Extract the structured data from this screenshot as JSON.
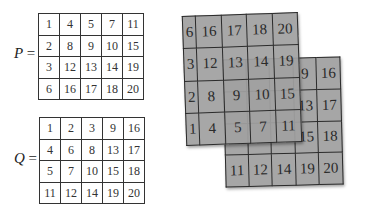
{
  "matrix_p": {
    "label": "P",
    "equals": "=",
    "rows": [
      [
        "1",
        "4",
        "5",
        "7",
        "11"
      ],
      [
        "2",
        "8",
        "9",
        "10",
        "15"
      ],
      [
        "3",
        "12",
        "13",
        "14",
        "19"
      ],
      [
        "6",
        "16",
        "17",
        "18",
        "20"
      ]
    ]
  },
  "matrix_q": {
    "label": "Q",
    "equals": "=",
    "rows": [
      [
        "1",
        "2",
        "3",
        "9",
        "16"
      ],
      [
        "4",
        "6",
        "8",
        "13",
        "17"
      ],
      [
        "5",
        "7",
        "10",
        "15",
        "18"
      ],
      [
        "11",
        "12",
        "14",
        "19",
        "20"
      ]
    ]
  },
  "sheet_p": {
    "rows": [
      [
        "6",
        "16",
        "17",
        "18",
        "20"
      ],
      [
        "3",
        "12",
        "13",
        "14",
        "19"
      ],
      [
        "2",
        "8",
        "9",
        "10",
        "15"
      ],
      [
        "1",
        "4",
        "5",
        "7",
        "11"
      ]
    ]
  },
  "sheet_q": {
    "rows": [
      [
        "11",
        "12",
        "14",
        "9",
        "16"
      ],
      [
        "",
        "",
        "",
        "13",
        "17"
      ],
      [
        "",
        "",
        "",
        "15",
        "18"
      ],
      [
        "11",
        "12",
        "14",
        "19",
        "20"
      ]
    ],
    "visible_bottom_row": [
      "11",
      "12",
      "14",
      "19",
      "20"
    ],
    "visible_right_cols": [
      [
        "9",
        "16"
      ],
      [
        "13",
        "17"
      ],
      [
        "15",
        "18"
      ]
    ]
  },
  "colors": {
    "sheet_fill": "#a6a6a6",
    "grid_line": "#2b2b2b",
    "background": "#ffffff"
  }
}
